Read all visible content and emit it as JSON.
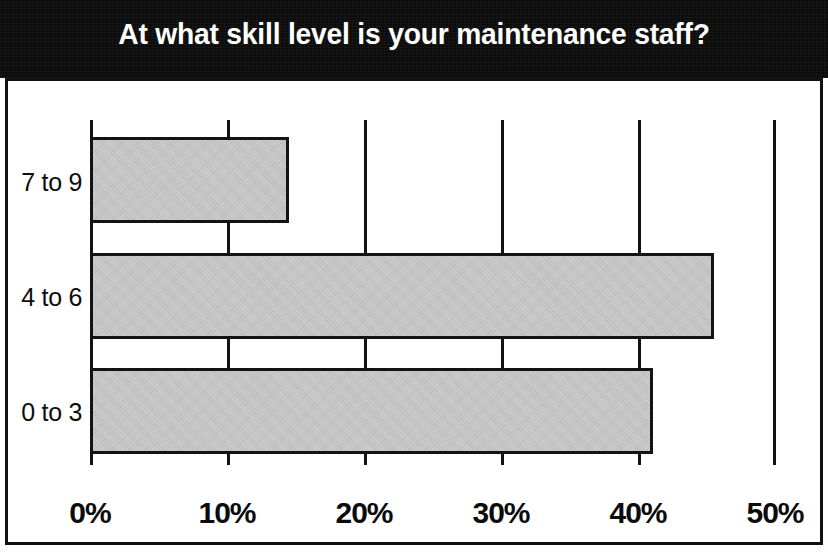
{
  "chart_data": {
    "type": "bar",
    "orientation": "horizontal",
    "title": "At what skill level is your maintenance staff?",
    "xlabel": "",
    "ylabel": "",
    "categories": [
      "0 to 3",
      "4 to 6",
      "7 to 9"
    ],
    "values": [
      41,
      45.5,
      14.5
    ],
    "value_unit": "%",
    "xlim": [
      0,
      50
    ],
    "xticks": [
      0,
      10,
      20,
      30,
      40,
      50
    ],
    "xtick_labels": [
      "0%",
      "10%",
      "20%",
      "30%",
      "40%",
      "50%"
    ],
    "ytick_labels_top_to_bottom": [
      "7 to 9",
      "4 to 6",
      "0 to 3"
    ],
    "grid": "vertical-only",
    "legend": "none",
    "series": [
      {
        "name": "Share of respondents",
        "values": [
          41,
          45.5,
          14.5
        ]
      }
    ],
    "bars_top_to_bottom": [
      {
        "category": "7 to 9",
        "value": 14.5
      },
      {
        "category": "4 to 6",
        "value": 45.5
      },
      {
        "category": "0 to 3",
        "value": 41
      }
    ]
  },
  "style": {
    "banner_background": "#0c0c0c",
    "title_color": "#ffffff",
    "bar_fill": "#c9c9c9",
    "bar_border": "#131313",
    "gridline_color": "#121212",
    "frame_color": "#111111",
    "page_background": "#ffffff"
  },
  "banner": {
    "title": "At what skill level is your maintenance staff?"
  },
  "axes": {
    "x_ticks": [
      "0%",
      "10%",
      "20%",
      "30%",
      "40%",
      "50%"
    ],
    "y_ticks": [
      "7 to 9",
      "4 to 6",
      "0 to 3"
    ]
  }
}
